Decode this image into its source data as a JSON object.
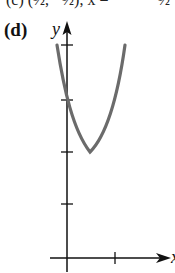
{
  "top_line": {
    "left": "(c)   (½, −½), x =",
    "right": "½"
  },
  "figure": {
    "label": "(d)",
    "y_axis_label": "y",
    "x_axis_label": "x",
    "curve": "parabola opening upward",
    "colors": {
      "axes": "#111111",
      "curve": "#6b6b6b"
    }
  }
}
